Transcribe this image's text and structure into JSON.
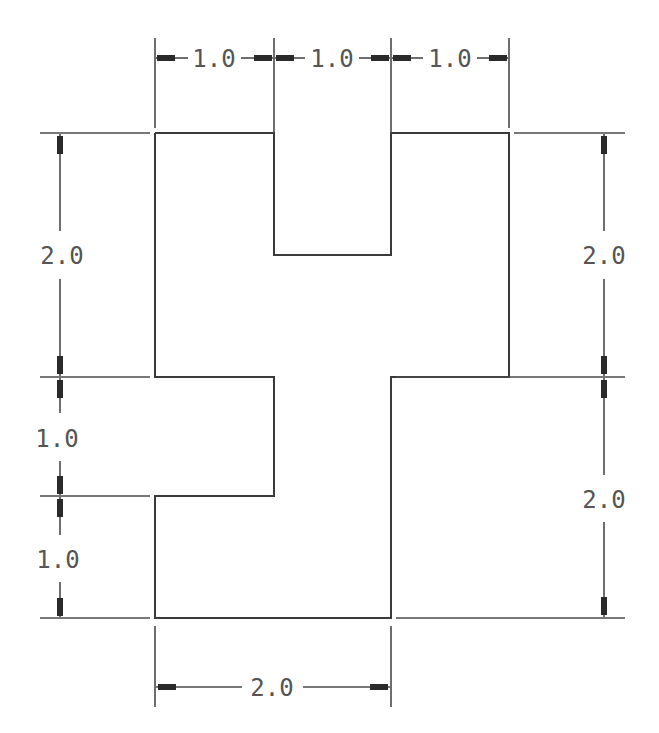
{
  "drawing": {
    "title": "",
    "units_label": "",
    "colors": {
      "line": "#3a3a3a",
      "text": "#555555",
      "background": "#ffffff"
    }
  },
  "dimensions": {
    "top": [
      {
        "label": "1.0"
      },
      {
        "label": "1.0"
      },
      {
        "label": "1.0"
      }
    ],
    "left": [
      {
        "label": "2.0"
      },
      {
        "label": "1.0"
      },
      {
        "label": "1.0"
      }
    ],
    "right": [
      {
        "label": "2.0"
      },
      {
        "label": "2.0"
      }
    ],
    "bottom": [
      {
        "label": "2.0"
      }
    ]
  }
}
